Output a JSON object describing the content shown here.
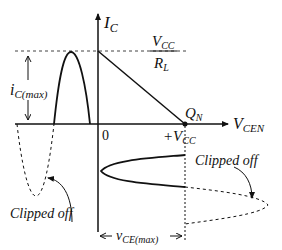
{
  "diagram": {
    "type": "transistor load-line / clipping diagram",
    "axes": {
      "y_label_main": "I",
      "y_label_sub": "C",
      "x_label_main": "V",
      "x_label_sub": "CEN",
      "origin_label": "0"
    },
    "load_line": {
      "top_numerator_main": "V",
      "top_numerator_sub": "CC",
      "top_denominator_main": "R",
      "top_denominator_sub": "L",
      "q_point_main": "Q",
      "q_point_sub": "N",
      "vcc_label_main": "+V",
      "vcc_label_sub": "CC"
    },
    "current_waveform": {
      "amplitude_label_main": "i",
      "amplitude_label_sub": "C(max)",
      "clipped_label": "Clipped off"
    },
    "voltage_waveform": {
      "amplitude_label_main": "v",
      "amplitude_label_sub": "CE(max)",
      "clipped_label": "Clipped off"
    },
    "colors": {
      "stroke": "#111111",
      "background": "#ffffff"
    }
  }
}
